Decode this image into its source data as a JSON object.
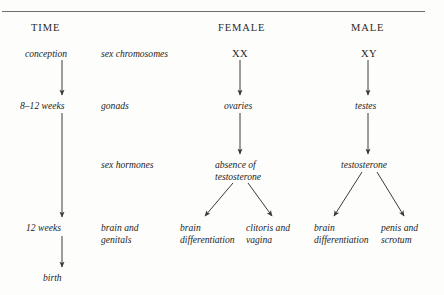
{
  "page": {
    "top_cut_text": "·  ·",
    "divider": "horizontal-rule"
  },
  "headers": {
    "time": "TIME",
    "female": "FEMALE",
    "male": "MALE"
  },
  "time_column": {
    "stage_1": "conception",
    "stage_2": "8–12 weeks",
    "stage_3": "12 weeks",
    "stage_4": "birth"
  },
  "process_column": {
    "row_1": "sex chromosomes",
    "row_2": "gonads",
    "row_3": "sex hormones",
    "row_4_line_1": "brain and",
    "row_4_line_2": "genitals"
  },
  "female_column": {
    "chromosomes": "XX",
    "gonad": "ovaries",
    "hormone_line_1": "absence of",
    "hormone_line_2": "testosterone",
    "outcome_left_line_1": "brain",
    "outcome_left_line_2": "differentiation",
    "outcome_right_line_1": "clitoris and",
    "outcome_right_line_2": "vagina"
  },
  "male_column": {
    "chromosomes": "XY",
    "gonad": "testes",
    "hormone": "testosterone",
    "outcome_left_line_1": "brain",
    "outcome_left_line_2": "differentiation",
    "outcome_right_line_1": "penis and",
    "outcome_right_line_2": "scrotum"
  },
  "colors": {
    "background": "#fdfdfc",
    "text": "#1d1d1d",
    "rule": "#6f6f6f",
    "arrow": "#3b3b3b"
  }
}
